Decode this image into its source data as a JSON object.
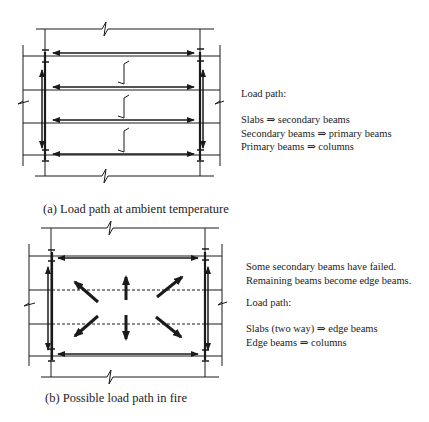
{
  "panel_a": {
    "caption": "(a) Load path at ambient temperature",
    "heading": "Load path:",
    "lines": [
      "Slabs ⇒ secondary beams",
      "Secondary beams ⇒ primary beams",
      "Primary beams ⇒ columns"
    ]
  },
  "panel_b": {
    "caption": "(b) Possible load path in fire",
    "note": [
      "Some secondary beams have failed.",
      "Remaining beams become edge beams."
    ],
    "heading": "Load path:",
    "lines": [
      "Slabs (two way) ⇒ edge beams",
      "Edge beams ⇒ columns"
    ]
  },
  "colors": {
    "ink": "#1a1a1a",
    "background": "#ffffff"
  }
}
